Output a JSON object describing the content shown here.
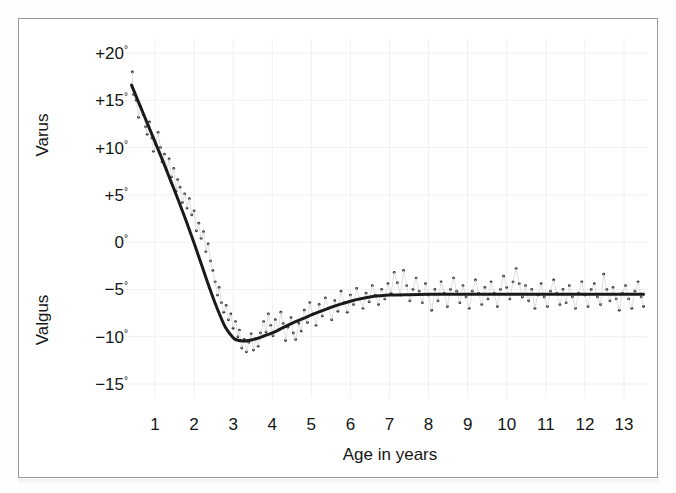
{
  "figure": {
    "background_color": "#ffffff",
    "frame_color": "#9a9a9a",
    "curve_color": "#1a1a1a",
    "point_color": "#3a3a3a",
    "grid_color": "#f0f0f0"
  },
  "chart_data": {
    "type": "scatter",
    "title": "",
    "subtitle": "",
    "xlabel": "Age in years",
    "ylabel": "",
    "ylabel_upper": "Varus",
    "ylabel_lower": "Valgus",
    "xlim": [
      0.25,
      13.6
    ],
    "ylim": [
      -16.5,
      21.5
    ],
    "grid": true,
    "legend": "none",
    "xticks": [
      1,
      2,
      3,
      4,
      5,
      6,
      7,
      8,
      9,
      10,
      11,
      12,
      13
    ],
    "xtick_labels": [
      "1",
      "2",
      "3",
      "4",
      "5",
      "6",
      "7",
      "8",
      "9",
      "10",
      "11",
      "12",
      "13"
    ],
    "yticks": [
      20,
      15,
      10,
      5,
      0,
      -5,
      -10,
      -15
    ],
    "ytick_labels": [
      "+20°",
      "+15°",
      "+10°",
      "+5°",
      "0°",
      "−5°",
      "−10°",
      "−15°"
    ],
    "ytick_numbers": [
      "+20",
      "+15",
      "+10",
      "+5",
      "0",
      "−5",
      "−10",
      "−15"
    ],
    "degree_symbol": "°",
    "series": [
      {
        "name": "fitted-curve",
        "type": "line",
        "x": [
          0.4,
          0.6,
          0.8,
          1.0,
          1.2,
          1.4,
          1.6,
          1.8,
          2.0,
          2.2,
          2.4,
          2.6,
          2.8,
          3.0,
          3.1,
          3.25,
          3.4,
          3.6,
          3.8,
          4.0,
          4.25,
          4.5,
          4.75,
          5.0,
          5.25,
          5.5,
          5.75,
          6.0,
          6.25,
          6.5,
          6.75,
          7.0,
          7.5,
          8.0,
          8.5,
          9.0,
          9.5,
          10.0,
          10.5,
          11.0,
          11.5,
          12.0,
          12.5,
          13.0,
          13.5
        ],
        "y": [
          16.6,
          14.6,
          12.6,
          10.6,
          8.6,
          6.5,
          4.4,
          2.2,
          -0.1,
          -2.5,
          -4.9,
          -7.1,
          -9.0,
          -10.1,
          -10.35,
          -10.45,
          -10.4,
          -10.2,
          -9.9,
          -9.6,
          -9.1,
          -8.6,
          -8.15,
          -7.7,
          -7.3,
          -6.9,
          -6.55,
          -6.25,
          -6.0,
          -5.8,
          -5.68,
          -5.6,
          -5.55,
          -5.52,
          -5.52,
          -5.52,
          -5.52,
          -5.52,
          -5.52,
          -5.52,
          -5.52,
          -5.52,
          -5.52,
          -5.52,
          -5.52
        ]
      },
      {
        "name": "observations",
        "type": "scatter",
        "points": [
          [
            0.42,
            18.0
          ],
          [
            0.45,
            15.6
          ],
          [
            0.52,
            15.0
          ],
          [
            0.58,
            13.2
          ],
          [
            0.62,
            14.4
          ],
          [
            0.7,
            13.5
          ],
          [
            0.76,
            12.2
          ],
          [
            0.8,
            11.4
          ],
          [
            0.86,
            12.7
          ],
          [
            0.92,
            11.0
          ],
          [
            0.96,
            9.6
          ],
          [
            1.02,
            10.3
          ],
          [
            1.08,
            11.6
          ],
          [
            1.14,
            10.0
          ],
          [
            1.18,
            8.5
          ],
          [
            1.24,
            9.3
          ],
          [
            1.3,
            7.6
          ],
          [
            1.36,
            8.8
          ],
          [
            1.42,
            6.9
          ],
          [
            1.48,
            7.8
          ],
          [
            1.54,
            5.4
          ],
          [
            1.58,
            6.6
          ],
          [
            1.64,
            5.8
          ],
          [
            1.7,
            4.2
          ],
          [
            1.76,
            5.1
          ],
          [
            1.82,
            3.6
          ],
          [
            1.88,
            4.6
          ],
          [
            1.94,
            2.9
          ],
          [
            2.0,
            3.3
          ],
          [
            2.06,
            1.2
          ],
          [
            2.12,
            2.0
          ],
          [
            2.18,
            0.4
          ],
          [
            2.24,
            1.1
          ],
          [
            2.3,
            -1.0
          ],
          [
            2.36,
            -0.2
          ],
          [
            2.42,
            -2.0
          ],
          [
            2.48,
            -3.0
          ],
          [
            2.54,
            -4.2
          ],
          [
            2.6,
            -5.6
          ],
          [
            2.64,
            -4.8
          ],
          [
            2.7,
            -6.4
          ],
          [
            2.76,
            -7.4
          ],
          [
            2.82,
            -6.7
          ],
          [
            2.88,
            -8.2
          ],
          [
            2.94,
            -7.6
          ],
          [
            3.0,
            -9.1
          ],
          [
            3.06,
            -8.4
          ],
          [
            3.12,
            -10.0
          ],
          [
            3.16,
            -9.3
          ],
          [
            3.22,
            -11.2
          ],
          [
            3.28,
            -10.3
          ],
          [
            3.34,
            -11.6
          ],
          [
            3.4,
            -10.6
          ],
          [
            3.46,
            -9.7
          ],
          [
            3.52,
            -11.4
          ],
          [
            3.58,
            -10.2
          ],
          [
            3.64,
            -11.0
          ],
          [
            3.7,
            -9.6
          ],
          [
            3.78,
            -8.4
          ],
          [
            3.84,
            -9.5
          ],
          [
            3.9,
            -7.6
          ],
          [
            3.96,
            -8.8
          ],
          [
            4.02,
            -9.9
          ],
          [
            4.08,
            -8.2
          ],
          [
            4.16,
            -9.3
          ],
          [
            4.22,
            -7.4
          ],
          [
            4.28,
            -8.6
          ],
          [
            4.34,
            -10.4
          ],
          [
            4.4,
            -9.0
          ],
          [
            4.48,
            -8.0
          ],
          [
            4.54,
            -9.6
          ],
          [
            4.6,
            -10.3
          ],
          [
            4.68,
            -8.6
          ],
          [
            4.74,
            -9.4
          ],
          [
            4.82,
            -7.2
          ],
          [
            4.9,
            -8.5
          ],
          [
            4.96,
            -6.4
          ],
          [
            5.04,
            -7.6
          ],
          [
            5.12,
            -8.8
          ],
          [
            5.2,
            -6.6
          ],
          [
            5.28,
            -7.8
          ],
          [
            5.36,
            -5.9
          ],
          [
            5.44,
            -7.0
          ],
          [
            5.52,
            -8.2
          ],
          [
            5.6,
            -6.2
          ],
          [
            5.68,
            -7.3
          ],
          [
            5.76,
            -5.2
          ],
          [
            5.84,
            -6.4
          ],
          [
            5.92,
            -7.4
          ],
          [
            6.0,
            -5.6
          ],
          [
            6.08,
            -6.6
          ],
          [
            6.16,
            -4.9
          ],
          [
            6.24,
            -6.0
          ],
          [
            6.32,
            -7.0
          ],
          [
            6.4,
            -5.4
          ],
          [
            6.48,
            -6.3
          ],
          [
            6.56,
            -4.6
          ],
          [
            6.64,
            -5.6
          ],
          [
            6.72,
            -6.6
          ],
          [
            6.8,
            -5.0
          ],
          [
            6.88,
            -6.0
          ],
          [
            6.96,
            -4.4
          ],
          [
            7.04,
            -5.4
          ],
          [
            7.12,
            -3.2
          ],
          [
            7.2,
            -4.3
          ],
          [
            7.28,
            -5.6
          ],
          [
            7.36,
            -3.0
          ],
          [
            7.44,
            -4.6
          ],
          [
            7.52,
            -6.2
          ],
          [
            7.6,
            -5.0
          ],
          [
            7.68,
            -3.8
          ],
          [
            7.76,
            -5.2
          ],
          [
            7.84,
            -6.4
          ],
          [
            7.92,
            -4.4
          ],
          [
            8.0,
            -5.6
          ],
          [
            8.08,
            -7.2
          ],
          [
            8.16,
            -5.0
          ],
          [
            8.24,
            -6.2
          ],
          [
            8.32,
            -4.2
          ],
          [
            8.4,
            -5.4
          ],
          [
            8.48,
            -6.8
          ],
          [
            8.56,
            -5.0
          ],
          [
            8.64,
            -3.8
          ],
          [
            8.72,
            -5.2
          ],
          [
            8.8,
            -6.4
          ],
          [
            8.88,
            -4.6
          ],
          [
            8.96,
            -5.8
          ],
          [
            9.04,
            -7.0
          ],
          [
            9.12,
            -5.2
          ],
          [
            9.2,
            -4.0
          ],
          [
            9.28,
            -5.4
          ],
          [
            9.36,
            -6.6
          ],
          [
            9.44,
            -4.8
          ],
          [
            9.52,
            -6.0
          ],
          [
            9.6,
            -4.2
          ],
          [
            9.68,
            -5.4
          ],
          [
            9.76,
            -6.8
          ],
          [
            9.84,
            -5.0
          ],
          [
            9.92,
            -3.6
          ],
          [
            10.0,
            -4.8
          ],
          [
            10.08,
            -6.0
          ],
          [
            10.16,
            -4.2
          ],
          [
            10.24,
            -2.8
          ],
          [
            10.32,
            -4.4
          ],
          [
            10.4,
            -5.8
          ],
          [
            10.48,
            -4.6
          ],
          [
            10.56,
            -6.2
          ],
          [
            10.64,
            -5.0
          ],
          [
            10.72,
            -7.0
          ],
          [
            10.8,
            -5.6
          ],
          [
            10.88,
            -4.4
          ],
          [
            10.96,
            -5.8
          ],
          [
            11.04,
            -6.8
          ],
          [
            11.12,
            -5.2
          ],
          [
            11.2,
            -4.0
          ],
          [
            11.28,
            -5.4
          ],
          [
            11.36,
            -6.6
          ],
          [
            11.44,
            -5.0
          ],
          [
            11.52,
            -6.4
          ],
          [
            11.6,
            -4.6
          ],
          [
            11.68,
            -5.8
          ],
          [
            11.76,
            -7.0
          ],
          [
            11.84,
            -5.4
          ],
          [
            11.92,
            -4.2
          ],
          [
            12.0,
            -5.6
          ],
          [
            12.08,
            -6.8
          ],
          [
            12.16,
            -5.0
          ],
          [
            12.24,
            -4.4
          ],
          [
            12.32,
            -5.8
          ],
          [
            12.4,
            -6.6
          ],
          [
            12.48,
            -3.4
          ],
          [
            12.56,
            -5.0
          ],
          [
            12.64,
            -6.2
          ],
          [
            12.72,
            -4.8
          ],
          [
            12.8,
            -6.0
          ],
          [
            12.88,
            -7.2
          ],
          [
            12.96,
            -5.4
          ],
          [
            13.04,
            -4.6
          ],
          [
            13.12,
            -6.0
          ],
          [
            13.2,
            -7.0
          ],
          [
            13.28,
            -5.2
          ],
          [
            13.36,
            -4.2
          ],
          [
            13.44,
            -5.8
          ],
          [
            13.5,
            -6.8
          ]
        ]
      }
    ]
  }
}
